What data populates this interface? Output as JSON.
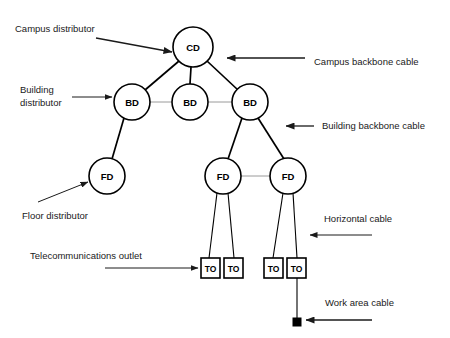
{
  "diagram": {
    "colors": {
      "stroke": "#000000",
      "background": "#ffffff",
      "annotation": "#1a1a1a",
      "faint_link": "#9a9a9a"
    },
    "nodes": [
      {
        "id": "cd",
        "label": "CD",
        "shape": "circle",
        "cx": 193,
        "cy": 47,
        "r": 20
      },
      {
        "id": "bd1",
        "label": "BD",
        "shape": "circle",
        "cx": 132,
        "cy": 102,
        "r": 18
      },
      {
        "id": "bd2",
        "label": "BD",
        "shape": "circle",
        "cx": 190,
        "cy": 102,
        "r": 18
      },
      {
        "id": "bd3",
        "label": "BD",
        "shape": "circle",
        "cx": 250,
        "cy": 102,
        "r": 18
      },
      {
        "id": "fd1",
        "label": "FD",
        "shape": "circle",
        "cx": 107,
        "cy": 176,
        "r": 18
      },
      {
        "id": "fd2",
        "label": "FD",
        "shape": "circle",
        "cx": 223,
        "cy": 176,
        "r": 18
      },
      {
        "id": "fd3",
        "label": "FD",
        "shape": "circle",
        "cx": 288,
        "cy": 176,
        "r": 18
      },
      {
        "id": "to1",
        "label": "TO",
        "shape": "box",
        "x": 201,
        "y": 258,
        "w": 19,
        "h": 20
      },
      {
        "id": "to2",
        "label": "TO",
        "shape": "box",
        "x": 224,
        "y": 258,
        "w": 19,
        "h": 20
      },
      {
        "id": "to3",
        "label": "TO",
        "shape": "box",
        "x": 264,
        "y": 258,
        "w": 19,
        "h": 20
      },
      {
        "id": "to4",
        "label": "TO",
        "shape": "box",
        "x": 287,
        "y": 258,
        "w": 19,
        "h": 20
      }
    ],
    "links": [
      {
        "from": "cd",
        "to": "bd1",
        "kind": "campus-backbone"
      },
      {
        "from": "cd",
        "to": "bd2",
        "kind": "campus-backbone"
      },
      {
        "from": "cd",
        "to": "bd3",
        "kind": "campus-backbone"
      },
      {
        "from": "bd1",
        "to": "bd2",
        "kind": "campus-backbone-optional"
      },
      {
        "from": "bd2",
        "to": "bd3",
        "kind": "campus-backbone-optional"
      },
      {
        "from": "bd1",
        "to": "fd1",
        "kind": "building-backbone"
      },
      {
        "from": "bd3",
        "to": "fd2",
        "kind": "building-backbone"
      },
      {
        "from": "bd3",
        "to": "fd3",
        "kind": "building-backbone"
      },
      {
        "from": "fd2",
        "to": "fd3",
        "kind": "building-backbone-optional"
      },
      {
        "from": "fd2",
        "to": "to1",
        "kind": "horizontal"
      },
      {
        "from": "fd2",
        "to": "to2",
        "kind": "horizontal"
      },
      {
        "from": "fd3",
        "to": "to3",
        "kind": "horizontal"
      },
      {
        "from": "fd3",
        "to": "to4",
        "kind": "horizontal"
      },
      {
        "from": "to4",
        "to": "work-area-terminator",
        "kind": "work-area"
      }
    ],
    "annotations": [
      {
        "id": "campus-distributor",
        "text": "Campus distributor",
        "x": 15,
        "y": 29,
        "lines": 1
      },
      {
        "id": "building-distributor-line1",
        "text": "Building",
        "x": 20,
        "y": 90,
        "lines": 1
      },
      {
        "id": "building-distributor-line2",
        "text": "distributor",
        "x": 20,
        "y": 103,
        "lines": 1
      },
      {
        "id": "floor-distributor",
        "text": "Floor distributor",
        "x": 22,
        "y": 216,
        "lines": 1
      },
      {
        "id": "telecommunications-outlet",
        "text": "Telecommunications outlet",
        "x": 30,
        "y": 256,
        "lines": 1
      },
      {
        "id": "campus-backbone-cable",
        "text": "Campus backbone cable",
        "x": 314,
        "y": 62,
        "lines": 1
      },
      {
        "id": "building-backbone-cable",
        "text": "Building backbone cable",
        "x": 322,
        "y": 126,
        "lines": 1
      },
      {
        "id": "horizontal-cable",
        "text": "Horizontal cable",
        "x": 324,
        "y": 219,
        "lines": 1
      },
      {
        "id": "work-area-cable",
        "text": "Work area cable",
        "x": 325,
        "y": 303,
        "lines": 1
      }
    ],
    "legend": {
      "cd_meaning": "Campus distributor",
      "bd_meaning": "Building distributor",
      "fd_meaning": "Floor distributor",
      "to_meaning": "Telecommunications outlet"
    }
  }
}
